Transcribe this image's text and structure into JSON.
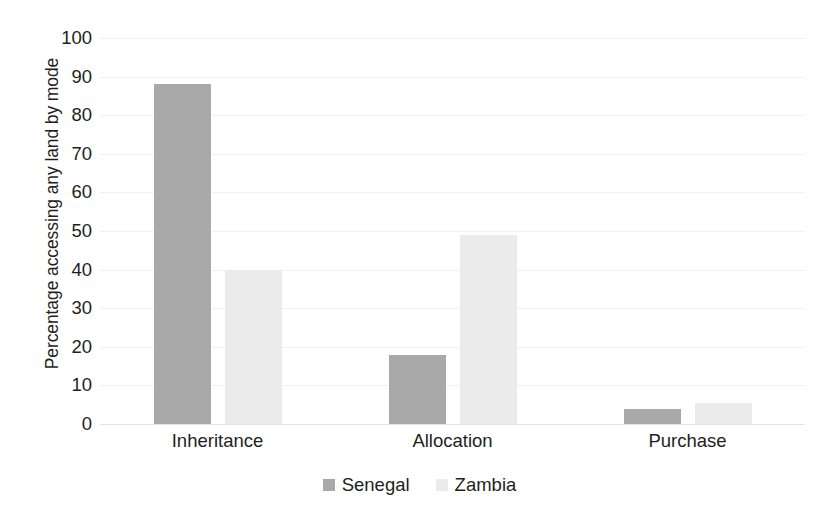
{
  "chart_data": {
    "type": "bar",
    "title": "",
    "subtitle": "",
    "xlabel": "",
    "ylabel": "Percentage accessing any land by mode",
    "categories": [
      "Inheritance",
      "Allocation",
      "Purchase"
    ],
    "series": [
      {
        "name": "Senegal",
        "color": "#a9a9a9",
        "values": [
          88,
          18,
          4
        ]
      },
      {
        "name": "Zambia",
        "color": "#ebebeb",
        "values": [
          40,
          49,
          5.5
        ]
      }
    ],
    "ylim": [
      0,
      100
    ],
    "ytick_step": 10,
    "yticks": [
      100,
      90,
      80,
      70,
      60,
      50,
      40,
      30,
      20,
      10,
      0
    ],
    "ytick_labels": [
      "100",
      "90",
      "80",
      "70",
      "60",
      "50",
      "40",
      "30",
      "20",
      "10",
      "0"
    ],
    "grid": true,
    "grid_axis": "y",
    "legend_position": "bottom",
    "legend_entries": [
      "Senegal",
      "Zambia"
    ]
  },
  "axis": {
    "y_title": "Percentage accessing any land by mode"
  },
  "legend": {
    "items": [
      {
        "label": "Senegal",
        "swatch": "senegal-swatch"
      },
      {
        "label": "Zambia",
        "swatch": "zambia-swatch"
      }
    ]
  }
}
